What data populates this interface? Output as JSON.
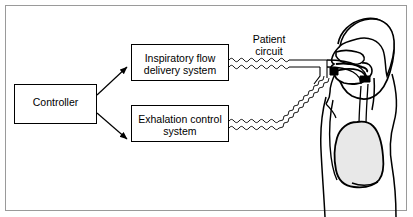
{
  "diagram": {
    "background_color": "#ffffff",
    "stroke_color": "#000000",
    "frame_color": "#9a9a9a",
    "lung_fill": "#e8e8e8",
    "boxes": [
      {
        "id": "controller",
        "label": "Controller",
        "x": 14,
        "y": 84,
        "width": 83,
        "height": 40
      },
      {
        "id": "inspiratory-flow-delivery-system",
        "label": "Inspiratory flow\ndelivery system",
        "x": 131,
        "y": 44,
        "width": 98,
        "height": 37
      },
      {
        "id": "exhalation-control-system",
        "label": "Exhalation control\nsystem",
        "x": 131,
        "y": 105,
        "width": 98,
        "height": 37
      }
    ],
    "annotations": [
      {
        "id": "patient-circuit",
        "label": "Patient\ncircuit",
        "x": 238,
        "y": 33
      }
    ],
    "arrows": [
      {
        "id": "controller-to-inspiratory",
        "from": "controller",
        "to": "inspiratory-flow-delivery-system"
      },
      {
        "id": "controller-to-exhalation",
        "from": "controller",
        "to": "exhalation-control-system"
      }
    ],
    "tubing": [
      {
        "id": "inspiratory-limb",
        "style": "corrugated",
        "from": "inspiratory-flow-delivery-system",
        "to": "y-piece"
      },
      {
        "id": "expiratory-limb",
        "style": "corrugated",
        "from": "exhalation-control-system",
        "to": "y-piece"
      }
    ],
    "anatomy": {
      "id": "patient-sagittal-view",
      "parts": [
        "head",
        "nasal-cavity",
        "oral-cavity",
        "tongue",
        "pharynx",
        "trachea",
        "lung",
        "torso",
        "endotracheal-tube"
      ]
    }
  }
}
